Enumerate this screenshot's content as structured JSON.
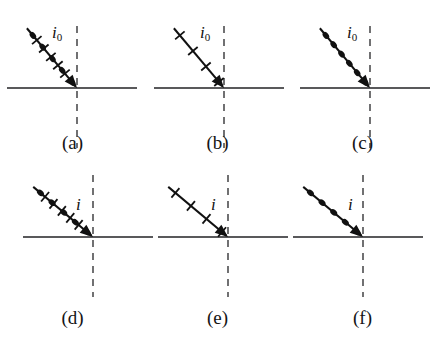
{
  "figure": {
    "background_color": "#ffffff",
    "width": 436,
    "height": 343,
    "surface_line_color": "#59595b",
    "normal_line_color": "#6a6a6c",
    "ray_color": "#111111",
    "label_color": "#111111"
  },
  "legend_semantics": {
    "dot_marker": "electric vector perpendicular to plane of incidence",
    "tick_marker": "electric vector parallel to plane of incidence"
  },
  "panels": [
    {
      "id": "a",
      "caption": "(a)",
      "angle_label_base": "i",
      "angle_label_sub": "0",
      "markers": "dots-and-ticks",
      "dot_count": 5,
      "tick_count": 5,
      "ray_angle_deg": 40,
      "polarization": "unpolarized",
      "row": "top",
      "column": 1
    },
    {
      "id": "b",
      "caption": "(b)",
      "angle_label_base": "i",
      "angle_label_sub": "0",
      "markers": "ticks",
      "dot_count": 0,
      "tick_count": 4,
      "ray_angle_deg": 40,
      "polarization": "parallel to plane of incidence",
      "row": "top",
      "column": 2
    },
    {
      "id": "c",
      "caption": "(c)",
      "angle_label_base": "i",
      "angle_label_sub": "0",
      "markers": "dots",
      "dot_count": 6,
      "tick_count": 0,
      "ray_angle_deg": 40,
      "polarization": "perpendicular to plane of incidence",
      "row": "top",
      "column": 3
    },
    {
      "id": "d",
      "caption": "(d)",
      "angle_label_base": "i",
      "angle_label_sub": "",
      "markers": "dots-and-ticks",
      "dot_count": 5,
      "tick_count": 5,
      "ray_angle_deg": 50,
      "polarization": "unpolarized",
      "row": "bottom",
      "column": 1
    },
    {
      "id": "e",
      "caption": "(e)",
      "angle_label_base": "i",
      "angle_label_sub": "",
      "markers": "ticks",
      "dot_count": 0,
      "tick_count": 4,
      "ray_angle_deg": 50,
      "polarization": "parallel to plane of incidence",
      "row": "bottom",
      "column": 2
    },
    {
      "id": "f",
      "caption": "(f)",
      "angle_label_base": "i",
      "angle_label_sub": "",
      "markers": "dots",
      "dot_count": 5,
      "tick_count": 0,
      "ray_angle_deg": 50,
      "polarization": "perpendicular to plane of incidence",
      "row": "bottom",
      "column": 3
    }
  ]
}
